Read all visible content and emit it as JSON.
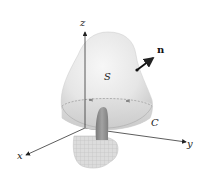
{
  "figure": {
    "labels": {
      "z_axis": "z",
      "y_axis": "y",
      "x_axis": "x",
      "surface": "S",
      "normal": "n",
      "curve": "C"
    },
    "colors": {
      "surface_fill": "#e9e9e9",
      "surface_shadow": "#cfcfcf",
      "base_fill": "#d8d8d8",
      "axis": "#333333",
      "thumb": "#8f8f8f",
      "hand": "#d2d2d2",
      "normal_arrow": "#111111"
    }
  }
}
